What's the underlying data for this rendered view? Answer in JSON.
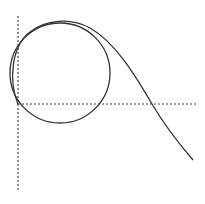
{
  "diagram": {
    "width": 205,
    "height": 204,
    "background": "#ffffff",
    "stroke_color": "#333333",
    "axes": {
      "vertical": {
        "x": 18,
        "y1": 16,
        "y2": 191,
        "dash": "2,2"
      },
      "horizontal": {
        "y": 104,
        "x1": 18,
        "x2": 197,
        "dash": "2,2"
      }
    },
    "circle": {
      "cx": 60,
      "cy": 73,
      "r": 50
    },
    "curve": {
      "description": "smooth curve starting at origin of axes, hugging left/top of circle, then descending to lower right",
      "path": "M 18 104 C 8 80, 12 45, 30 32 C 45 20, 70 17, 90 28 C 115 42, 135 75, 152 104 C 165 126, 180 145, 193 160"
    }
  }
}
